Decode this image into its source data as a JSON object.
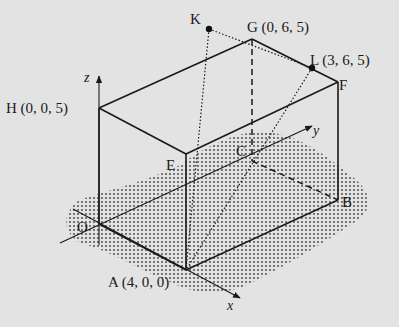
{
  "diagram": {
    "type": "3d-cuboid",
    "background": "#e3e3e3",
    "ink": "#1a1a1a",
    "axes": [
      {
        "name": "x",
        "label": "x"
      },
      {
        "name": "y",
        "label": "y"
      },
      {
        "name": "z",
        "label": "z"
      }
    ],
    "vertices": {
      "O": {
        "label": "O",
        "coords": "(0, 0, 0)",
        "display": "O"
      },
      "A": {
        "label": "A",
        "coords": "(4, 0, 0)",
        "display": "A (4, 0, 0)"
      },
      "B": {
        "label": "B",
        "display": "B"
      },
      "C": {
        "label": "C",
        "display": "C"
      },
      "E": {
        "label": "E",
        "display": "E"
      },
      "F": {
        "label": "F",
        "display": "F"
      },
      "G": {
        "label": "G",
        "coords": "(0, 6, 5)",
        "display": "G (0, 6, 5)"
      },
      "H": {
        "label": "H",
        "coords": "(0, 0, 5)",
        "display": "H (0, 0, 5)"
      },
      "K": {
        "label": "K",
        "display": "K"
      },
      "L": {
        "label": "L",
        "coords": "(3, 6, 5)",
        "display": "L (3, 6, 5)"
      }
    },
    "points_marked": [
      "K",
      "L"
    ],
    "solid_edges": [
      "H-K-G",
      "G-F",
      "H-E",
      "E-F",
      "O-H",
      "A-E",
      "F-B",
      "O-A",
      "A-B"
    ],
    "hidden_edges": [
      "G-C",
      "C-B"
    ],
    "dotted_lines": [
      "K-L",
      "K-A",
      "L-A"
    ],
    "shaded_region": "ground plane (z = 0) stippled area"
  }
}
